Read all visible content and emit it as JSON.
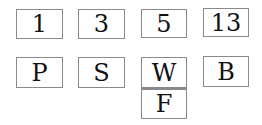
{
  "top_row": [
    {
      "label": "1"
    },
    {
      "label": "3"
    },
    {
      "label": "5"
    },
    {
      "label": "13"
    }
  ],
  "bottom_row": [
    {
      "label": "P"
    },
    {
      "label": "S"
    },
    {
      "label": "W"
    },
    {
      "label": "B"
    }
  ],
  "stacked": {
    "label": "F"
  },
  "colors": {
    "border": "#8a8a8a",
    "text": "#111111",
    "background": "#ffffff"
  }
}
